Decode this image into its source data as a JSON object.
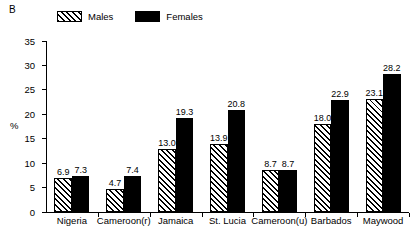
{
  "panel": {
    "label": "B"
  },
  "legend": {
    "entries": [
      {
        "label": "Males",
        "swatch": "hatched-diagonal"
      },
      {
        "label": "Females",
        "swatch": "solid-black"
      }
    ]
  },
  "chart_data": {
    "type": "bar",
    "title": "",
    "subtitle": "",
    "xlabel": "",
    "ylabel": "%",
    "ylim": [
      0,
      35
    ],
    "yticks": [
      0,
      5,
      10,
      15,
      20,
      25,
      30,
      35
    ],
    "grid": false,
    "legend_position": "top-left",
    "categories": [
      "Nigeria",
      "Cameroon(r)",
      "Jamaica",
      "St. Lucia",
      "Cameroon(u)",
      "Barbados",
      "Maywood"
    ],
    "series": [
      {
        "name": "Males",
        "values": [
          6.9,
          4.7,
          13.0,
          13.9,
          8.7,
          18.0,
          23.1
        ],
        "labels": [
          "6.9",
          "4.7",
          "13.0",
          "13.9",
          "8.7",
          "18.0",
          "23.1"
        ]
      },
      {
        "name": "Females",
        "values": [
          7.3,
          7.4,
          19.3,
          20.8,
          8.7,
          22.9,
          28.2
        ],
        "labels": [
          "7.3",
          "7.4",
          "19.3",
          "20.8",
          "8.7",
          "22.9",
          "28.2"
        ]
      }
    ]
  },
  "colors": {
    "axis": "#000000",
    "males_fill": "#ffffff",
    "males_pattern": "#000000",
    "females_fill": "#000000",
    "background": "#ffffff"
  }
}
